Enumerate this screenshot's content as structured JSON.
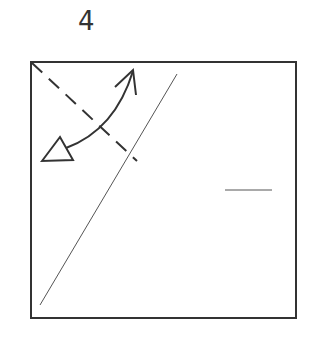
{
  "diagram": {
    "step_number": "4",
    "type": "origami-fold-instruction",
    "colors": {
      "stroke": "#333333",
      "thin_stroke": "#555555",
      "background": "#ffffff"
    },
    "elements": [
      {
        "name": "paper-square",
        "kind": "rect",
        "x": 31,
        "y": 62,
        "width": 265,
        "height": 256
      },
      {
        "name": "valley-fold-line",
        "kind": "dashed-line",
        "from": [
          31,
          62
        ],
        "to": [
          137,
          161
        ]
      },
      {
        "name": "crease-line",
        "kind": "thin-line",
        "from": [
          40,
          305
        ],
        "to": [
          177,
          74
        ]
      },
      {
        "name": "fold-arrow",
        "kind": "curved-arrow",
        "from": [
          55,
          144
        ],
        "to": [
          132,
          70
        ],
        "heads": [
          "open-triangle",
          "open-chevron"
        ]
      },
      {
        "name": "reference-mark",
        "kind": "short-line",
        "from": [
          225,
          190
        ],
        "to": [
          272,
          190
        ]
      }
    ]
  }
}
